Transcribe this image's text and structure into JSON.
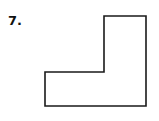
{
  "problem": {
    "number_label": "7.",
    "shape": {
      "type": "L-shaped polygon",
      "points": [
        [
          104,
          16
        ],
        [
          146,
          16
        ],
        [
          146,
          106
        ],
        [
          45,
          106
        ],
        [
          45,
          72
        ],
        [
          104,
          72
        ]
      ],
      "stroke_color": "#1a1a1a",
      "fill_color": "#ffffff"
    }
  }
}
